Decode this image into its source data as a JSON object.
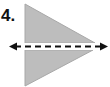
{
  "problem": {
    "number_label": "4."
  },
  "figure": {
    "shape_fill": "#bdbdbd",
    "shape_stroke": "#a8a8a8",
    "line_color": "#111111"
  }
}
